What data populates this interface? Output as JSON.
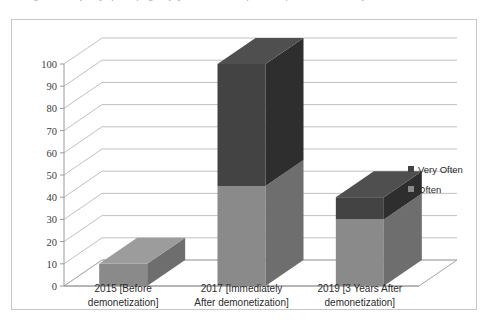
{
  "caption": {
    "text": "Figure 2: Frequency of use of digital payment methods before and after demonetization periods"
  },
  "chart_data": {
    "type": "bar",
    "subtype": "stacked-column-3d",
    "title": "",
    "xlabel": "",
    "ylabel": "",
    "ylim": [
      0,
      100
    ],
    "ytick_step": 10,
    "yticks": [
      0,
      10,
      20,
      30,
      40,
      50,
      60,
      70,
      80,
      90,
      100
    ],
    "ytick_labels": [
      "0",
      "10",
      "20",
      "30",
      "40",
      "50",
      "60",
      "70",
      "80",
      "90",
      "100"
    ],
    "grid": true,
    "legend_position": "right",
    "categories": [
      "2015 [Before demonetization]",
      "2017 [Immediately After demonetization]",
      "2019 [3 Years After demonetization]"
    ],
    "category_lines": [
      [
        "2015 [Before",
        "demonetization]"
      ],
      [
        "2017 [Immediately",
        "After demonetization]"
      ],
      [
        "2019 [3 Years After",
        "demonetization]"
      ]
    ],
    "series": [
      {
        "name": "Often",
        "color": "#8a8a8a",
        "side_color": "#6e6e6e",
        "top_color": "#9c9c9c",
        "values": [
          10,
          45,
          30
        ]
      },
      {
        "name": "Very Often",
        "color": "#434343",
        "side_color": "#2e2e2e",
        "top_color": "#4f4f4f",
        "values": [
          0,
          55,
          10
        ]
      }
    ],
    "stack_totals": [
      10,
      100,
      40
    ]
  },
  "legend": {
    "items": [
      {
        "label": "Very Often",
        "color": "#434343"
      },
      {
        "label": "Often",
        "color": "#8a8a8a"
      }
    ]
  },
  "colors": {
    "frame_border": "#c8c8c8",
    "gridline": "#b5b5b5",
    "axis": "#9a9a9a",
    "text": "#2b2b2b",
    "background": "#ffffff"
  }
}
